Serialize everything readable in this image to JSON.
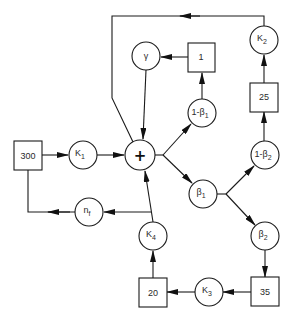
{
  "diagram": {
    "title": "",
    "nodes": {
      "box_300": {
        "shape": "box",
        "label": "300"
      },
      "k1": {
        "shape": "circle",
        "label": "K",
        "sub": "1"
      },
      "sum": {
        "shape": "circle",
        "label": "+",
        "role": "summing-junction"
      },
      "gamma": {
        "shape": "circle",
        "label": "γ"
      },
      "box_1": {
        "shape": "box",
        "label": "1"
      },
      "one_minus_beta1": {
        "shape": "circle",
        "label": "1-β",
        "sub": "1"
      },
      "beta1": {
        "shape": "circle",
        "label": "β",
        "sub": "1"
      },
      "one_minus_beta2": {
        "shape": "circle",
        "label": "1-β",
        "sub": "2"
      },
      "box_25": {
        "shape": "box",
        "label": "25"
      },
      "k2": {
        "shape": "circle",
        "label": "K",
        "sub": "2"
      },
      "beta2": {
        "shape": "circle",
        "label": "β",
        "sub": "2"
      },
      "box_35": {
        "shape": "box",
        "label": "35"
      },
      "k3": {
        "shape": "circle",
        "label": "K",
        "sub": "3"
      },
      "box_20": {
        "shape": "box",
        "label": "20"
      },
      "k4": {
        "shape": "circle",
        "label": "K",
        "sub": "4"
      },
      "nf": {
        "shape": "circle",
        "label": "n",
        "sub": "f"
      }
    },
    "edges": [
      [
        "300",
        "K1"
      ],
      [
        "K1",
        "+"
      ],
      [
        "γ",
        "+"
      ],
      [
        "1",
        "γ"
      ],
      [
        "+",
        "1-β1"
      ],
      [
        "1-β1",
        "1"
      ],
      [
        "+",
        "β1"
      ],
      [
        "β1",
        "1-β2"
      ],
      [
        "1-β2",
        "25"
      ],
      [
        "25",
        "K2"
      ],
      [
        "K2",
        "+"
      ],
      [
        "β1",
        "β2"
      ],
      [
        "β2",
        "35"
      ],
      [
        "35",
        "K3"
      ],
      [
        "K3",
        "20"
      ],
      [
        "20",
        "K4"
      ],
      [
        "K4",
        "+"
      ],
      [
        "K4",
        "nf"
      ],
      [
        "nf",
        "300"
      ]
    ]
  }
}
